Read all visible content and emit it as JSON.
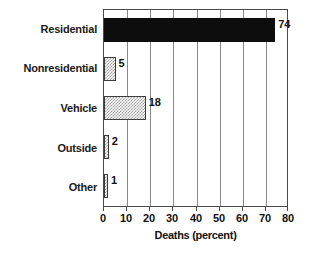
{
  "chart_data": {
    "type": "bar",
    "orientation": "horizontal",
    "title": "",
    "xlabel": "Deaths (percent)",
    "ylabel": "",
    "xlim": [
      0,
      80
    ],
    "xticks": [
      0,
      10,
      20,
      30,
      40,
      50,
      60,
      70,
      80
    ],
    "xtick_labels": [
      "0",
      "10",
      "20",
      "30",
      "40",
      "50",
      "60",
      "70",
      "80"
    ],
    "grid": true,
    "grid_axis": "x",
    "legend": false,
    "categories": [
      "Residential",
      "Nonresidential",
      "Vehicle",
      "Outside",
      "Other"
    ],
    "values": [
      74,
      5,
      18,
      2,
      1
    ],
    "value_labels": [
      "74",
      "5",
      "18",
      "2",
      "1"
    ],
    "bar_styles": [
      "solid",
      "hatch",
      "hatch",
      "hatch",
      "hatch"
    ],
    "colors": {
      "solid_fill": "#0d0d0d",
      "hatch_fill": "#9a9a9a",
      "background": "#ffffff",
      "axis": "#4a4a4a",
      "gridline": "#8a8a8a",
      "text": "#111111"
    },
    "bars": [
      {
        "category": "Residential",
        "value": 74,
        "label": "74",
        "style": "solid"
      },
      {
        "category": "Nonresidential",
        "value": 5,
        "label": "5",
        "style": "hatch"
      },
      {
        "category": "Vehicle",
        "value": 18,
        "label": "18",
        "style": "hatch"
      },
      {
        "category": "Outside",
        "value": 2,
        "label": "2",
        "style": "hatch"
      },
      {
        "category": "Other",
        "value": 1,
        "label": "1",
        "style": "hatch"
      }
    ]
  }
}
